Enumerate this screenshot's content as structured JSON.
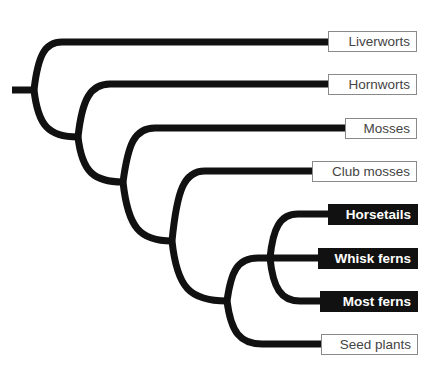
{
  "diagram": {
    "type": "phylogenetic-tree",
    "branch_color": "#111111",
    "taxa": [
      {
        "id": "liverworts",
        "label": "Liverworts",
        "style": "outline",
        "highlighted": false
      },
      {
        "id": "hornworts",
        "label": "Hornworts",
        "style": "outline",
        "highlighted": false
      },
      {
        "id": "mosses",
        "label": "Mosses",
        "style": "outline",
        "highlighted": false
      },
      {
        "id": "club-mosses",
        "label": "Club mosses",
        "style": "outline",
        "highlighted": false
      },
      {
        "id": "horsetails",
        "label": "Horsetails",
        "style": "filled",
        "highlighted": true
      },
      {
        "id": "whisk-ferns",
        "label": "Whisk ferns",
        "style": "filled",
        "highlighted": true
      },
      {
        "id": "most-ferns",
        "label": "Most ferns",
        "style": "filled",
        "highlighted": true
      },
      {
        "id": "seed-plants",
        "label": "Seed plants",
        "style": "outline",
        "highlighted": false
      }
    ],
    "topology": "(Liverworts,(Hornworts,(Mosses,(Club mosses,((Horsetails,Whisk ferns,Most ferns),Seed plants)))))"
  }
}
